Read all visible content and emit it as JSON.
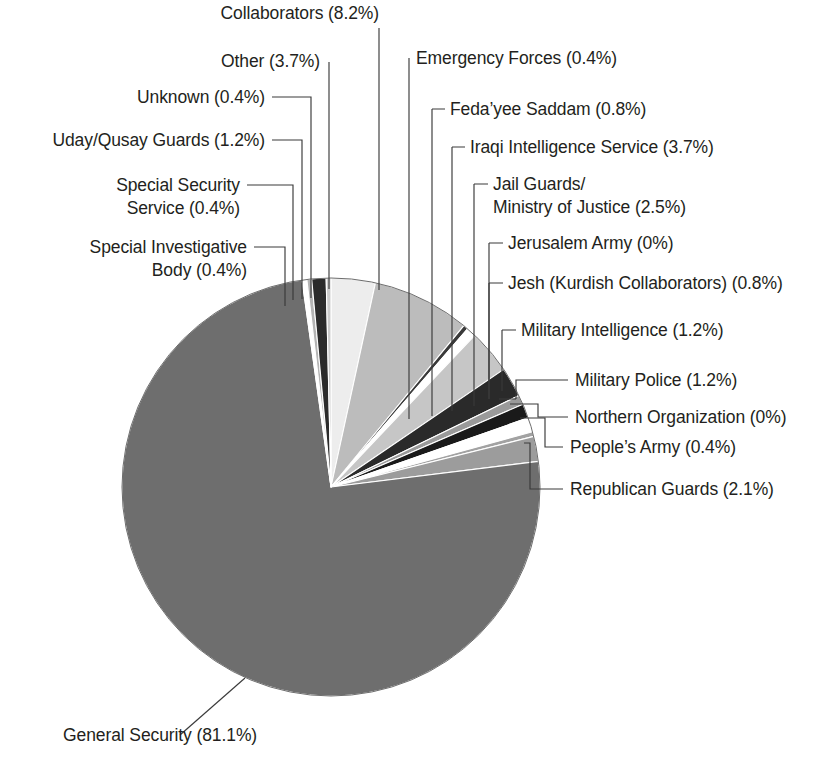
{
  "chart_data": {
    "type": "pie",
    "title": "",
    "units": "percent",
    "total_percent": 100,
    "legend_position": "callout-labels",
    "categories": [
      "General Security",
      "Special Investigative Body",
      "Special Security Service",
      "Uday/Qusay Guards",
      "Unknown",
      "Other",
      "Collaborators",
      "Emergency Forces",
      "Feda'yee Saddam",
      "Iraqi Intelligence Service",
      "Jail Guards/Ministry of Justice",
      "Jerusalem Army",
      "Jesh (Kurdish Collaborators)",
      "Military Intelligence",
      "Military Police",
      "Northern Organization",
      "People's Army",
      "Republican Guards"
    ],
    "values": [
      81.1,
      0.4,
      0.4,
      1.2,
      0.4,
      3.7,
      8.2,
      0.4,
      0.8,
      3.7,
      2.5,
      0,
      0.8,
      1.2,
      1.2,
      0,
      0.4,
      2.1
    ],
    "slices": [
      {
        "name": "General Security",
        "label": "General Security (81.1%)",
        "value": 81.1,
        "color": "#6e6e6e"
      },
      {
        "name": "Special Investigative Body",
        "label": "Special Investigative\nBody (0.4%)",
        "value": 0.4,
        "color": "#ffffff"
      },
      {
        "name": "Special Security Service",
        "label": "Special Security\nService (0.4%)",
        "value": 0.4,
        "color": "#b4b4b4"
      },
      {
        "name": "Uday/Qusay Guards",
        "label": "Uday/Qusay Guards (1.2%)",
        "value": 1.2,
        "color": "#2b2b2b"
      },
      {
        "name": "Unknown",
        "label": "Unknown (0.4%)",
        "value": 0.4,
        "color": "#cbcbcb"
      },
      {
        "name": "Other",
        "label": "Other (3.7%)",
        "value": 3.7,
        "color": "#ededed"
      },
      {
        "name": "Collaborators",
        "label": "Collaborators (8.2%)",
        "value": 8.2,
        "color": "#bcbcbc"
      },
      {
        "name": "Emergency Forces",
        "label": "Emergency Forces (0.4%)",
        "value": 0.4,
        "color": "#3a3a3a"
      },
      {
        "name": "Feda'yee Saddam",
        "label": "Feda’yee Saddam (0.8%)",
        "value": 0.8,
        "color": "#ffffff"
      },
      {
        "name": "Iraqi Intelligence Service",
        "label": "Iraqi Intelligence Service (3.7%)",
        "value": 3.7,
        "color": "#c6c6c6"
      },
      {
        "name": "Jail Guards/Ministry of Justice",
        "label": "Jail Guards/\nMinistry of Justice (2.5%)",
        "value": 2.5,
        "color": "#2a2a2a"
      },
      {
        "name": "Jerusalem Army",
        "label": "Jerusalem Army (0%)",
        "value": 0,
        "color": "#8a8a8a"
      },
      {
        "name": "Jesh (Kurdish Collaborators)",
        "label": "Jesh (Kurdish Collaborators) (0.8%)",
        "value": 0.8,
        "color": "#9a9a9a"
      },
      {
        "name": "Military Intelligence",
        "label": "Military Intelligence (1.2%)",
        "value": 1.2,
        "color": "#1a1a1a"
      },
      {
        "name": "Military Police",
        "label": "Military Police (1.2%)",
        "value": 1.2,
        "color": "#ffffff"
      },
      {
        "name": "Northern Organization",
        "label": "Northern Organization (0%)",
        "value": 0,
        "color": "#8f8f8f"
      },
      {
        "name": "People's Army",
        "label": "People’s Army (0.4%)",
        "value": 0.4,
        "color": "#a2a2a2"
      },
      {
        "name": "Republican Guards",
        "label": "Republican Guards (2.1%)",
        "value": 2.1,
        "color": "#9c9c9c"
      }
    ]
  },
  "labels": [
    {
      "id": "collaborators",
      "lines": [
        "Collaborators (8.2%)"
      ],
      "x": 379,
      "y": 19,
      "anchor": "end"
    },
    {
      "id": "other",
      "lines": [
        "Other (3.7%)"
      ],
      "x": 320,
      "y": 67,
      "anchor": "end"
    },
    {
      "id": "unknown",
      "lines": [
        "Unknown (0.4%)"
      ],
      "x": 265,
      "y": 103,
      "anchor": "end"
    },
    {
      "id": "uday-qusay",
      "lines": [
        "Uday/Qusay Guards (1.2%)"
      ],
      "x": 265,
      "y": 146,
      "anchor": "end"
    },
    {
      "id": "special-security",
      "lines": [
        "Special Security",
        "Service (0.4%)"
      ],
      "x": 240,
      "y": 191,
      "anchor": "end"
    },
    {
      "id": "special-invest",
      "lines": [
        "Special Investigative",
        "Body (0.4%)"
      ],
      "x": 247,
      "y": 253,
      "anchor": "end"
    },
    {
      "id": "emergency",
      "lines": [
        "Emergency Forces (0.4%)"
      ],
      "x": 416,
      "y": 64,
      "anchor": "start"
    },
    {
      "id": "fedayee",
      "lines": [
        "Feda’yee Saddam (0.8%)"
      ],
      "x": 450,
      "y": 115,
      "anchor": "start"
    },
    {
      "id": "iraqi-intel",
      "lines": [
        "Iraqi Intelligence Service (3.7%)"
      ],
      "x": 470,
      "y": 153,
      "anchor": "start"
    },
    {
      "id": "jail-guards",
      "lines": [
        "Jail Guards/",
        "Ministry of Justice (2.5%)"
      ],
      "x": 493,
      "y": 190,
      "anchor": "start"
    },
    {
      "id": "jerusalem",
      "lines": [
        "Jerusalem Army (0%)"
      ],
      "x": 508,
      "y": 249,
      "anchor": "start"
    },
    {
      "id": "jesh",
      "lines": [
        "Jesh (Kurdish Collaborators) (0.8%)"
      ],
      "x": 508,
      "y": 289,
      "anchor": "start"
    },
    {
      "id": "mil-intel",
      "lines": [
        "Military Intelligence (1.2%)"
      ],
      "x": 521,
      "y": 336,
      "anchor": "start"
    },
    {
      "id": "mil-police",
      "lines": [
        "Military Police (1.2%)"
      ],
      "x": 575,
      "y": 386,
      "anchor": "start"
    },
    {
      "id": "northern",
      "lines": [
        "Northern Organization (0%)"
      ],
      "x": 575,
      "y": 423,
      "anchor": "start"
    },
    {
      "id": "peoples-army",
      "lines": [
        "People’s Army (0.4%)"
      ],
      "x": 570,
      "y": 453,
      "anchor": "start"
    },
    {
      "id": "republican",
      "lines": [
        "Republican Guards (2.1%)"
      ],
      "x": 570,
      "y": 495,
      "anchor": "start"
    },
    {
      "id": "general-security",
      "lines": [
        "General Security (81.1%)"
      ],
      "x": 63,
      "y": 741,
      "anchor": "start"
    }
  ],
  "leaders": [
    {
      "id": "collaborators",
      "d": "M 379,28 L 379,290"
    },
    {
      "id": "other",
      "d": "M 329,62 L 329,289"
    },
    {
      "id": "unknown",
      "d": "M 272,97 L 311,97 L 311,298"
    },
    {
      "id": "uday-qusay",
      "d": "M 272,140 L 302,140 L 302,299"
    },
    {
      "id": "special-security",
      "d": "M 247,185 L 293,185 L 293,300"
    },
    {
      "id": "special-invest",
      "d": "M 254,247 L 285,247 L 285,306"
    },
    {
      "id": "emergency",
      "d": "M 409,58 L 409,419"
    },
    {
      "id": "fedayee",
      "d": "M 432,109 L 445,109 M 432,109 L 432,416"
    },
    {
      "id": "iraqi-intel",
      "d": "M 452,147 L 465,147 M 452,147 L 452,411"
    },
    {
      "id": "jail-guards",
      "d": "M 474,184 L 488,184 M 474,184 L 474,406"
    },
    {
      "id": "jerusalem",
      "d": "M 489,243 L 503,243 M 489,243 L 489,399"
    },
    {
      "id": "jesh",
      "d": "M 489,283 L 503,283 M 489,283 L 489,399"
    },
    {
      "id": "mil-intel",
      "d": "M 502,330 L 516,330 M 502,330 L 502,391"
    },
    {
      "id": "mil-police",
      "d": "M 568,380 L 516,380 L 516,399 M 516,399 L 499,399"
    },
    {
      "id": "northern",
      "d": "M 568,417 L 538,417 L 538,404 L 510,404"
    },
    {
      "id": "peoples-army",
      "d": "M 563,447 L 545,447 L 545,418 L 520,418"
    },
    {
      "id": "republican",
      "d": "M 563,489 L 530,489 L 530,443 L 524,443"
    },
    {
      "id": "general-security",
      "d": "M 180,735 L 245,678"
    }
  ],
  "geometry": {
    "center_x": 331,
    "center_y": 487,
    "radius": 209,
    "start_angle_deg": -90
  }
}
